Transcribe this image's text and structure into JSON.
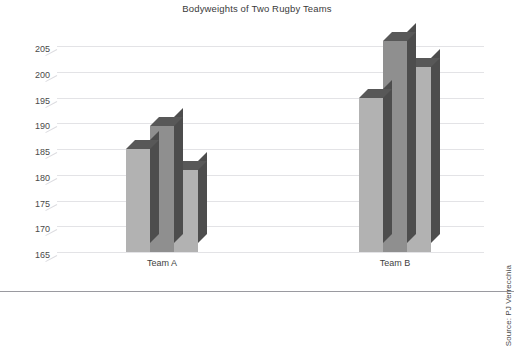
{
  "chart_data": {
    "type": "bar",
    "title": "Bodyweights of Two Rugby Teams",
    "xlabel": "",
    "ylabel": "",
    "categories": [
      "Team A",
      "Team B"
    ],
    "series": [
      {
        "name": "Series 1",
        "values": [
          185,
          195
        ]
      },
      {
        "name": "Series 2",
        "values": [
          189.5,
          206
        ]
      },
      {
        "name": "Series 3",
        "values": [
          181,
          201
        ]
      }
    ],
    "ylim": [
      165,
      207
    ],
    "yticks": [
      165,
      170,
      175,
      180,
      185,
      190,
      195,
      200,
      205
    ],
    "ytick_labels": [
      "165",
      "170",
      "175",
      "180",
      "185",
      "190",
      "195",
      "200",
      "205"
    ],
    "grid": true,
    "legend": false,
    "legend_position": "none",
    "style": "3d-column",
    "bar_colors": [
      "#b2b2b2",
      "#8f8f8f",
      "#b2b2b2"
    ],
    "bar_side_color": "#4d4d4d",
    "bar_top_color": "#585858",
    "gridline_color": "#e3e3e6",
    "background": "#ffffff",
    "annotations": [
      {
        "name": "source",
        "text": "Source: PJ Verrecchia",
        "rotation": -90,
        "position": "right-bottom"
      }
    ]
  },
  "axis": {
    "y_min_label": "165",
    "y_max_label": "205"
  },
  "footer": {
    "source": "Source: PJ Verrecchia"
  }
}
